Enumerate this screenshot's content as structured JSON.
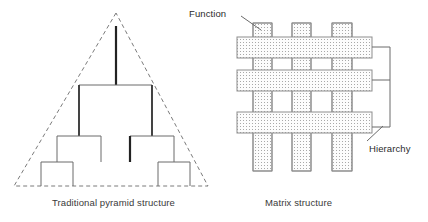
{
  "figure": {
    "background": "#ffffff",
    "stroke_color": "#555555",
    "bold_stroke_color": "#222222",
    "fill_color": "#fbfbfb",
    "pattern_color": "#9a9a9a"
  },
  "captions": {
    "pyramid": "Traditional pyramid structure",
    "matrix": "Matrix structure"
  },
  "annotations": {
    "function": {
      "label": "Function",
      "leader_from": [
        241,
        16
      ],
      "leader_to": [
        259,
        29
      ]
    },
    "hierarchy": {
      "label": "Hierarchy",
      "leader_from": [
        367,
        141
      ],
      "leader_to": [
        382,
        127
      ]
    }
  },
  "pyramid": {
    "triangle": {
      "apex": [
        116,
        13
      ],
      "left": [
        14,
        186
      ],
      "right": [
        208,
        186
      ],
      "dashed": true
    },
    "nodes": {
      "root_stem": {
        "x": 116,
        "y1": 26,
        "y2": 85,
        "bold": true
      },
      "level2_bar": {
        "y": 85,
        "x1": 79,
        "x2": 152
      },
      "level2_stems": [
        {
          "x": 79,
          "y1": 85,
          "y2": 136,
          "bold": true
        },
        {
          "x": 152,
          "y1": 85,
          "y2": 136,
          "bold": true
        }
      ],
      "level3_bars": [
        {
          "y": 136,
          "x1": 57,
          "x2": 101
        },
        {
          "y": 136,
          "x1": 130,
          "x2": 174
        }
      ],
      "level3_stems": [
        {
          "x": 57,
          "y1": 136,
          "y2": 162,
          "bold": false
        },
        {
          "x": 101,
          "y1": 136,
          "y2": 162,
          "bold": false
        },
        {
          "x": 130,
          "y1": 136,
          "y2": 162,
          "bold": true
        },
        {
          "x": 174,
          "y1": 136,
          "y2": 162,
          "bold": false
        }
      ],
      "level4_bars": [
        {
          "y": 162,
          "x1": 41,
          "x2": 73
        },
        {
          "y": 162,
          "x1": 158,
          "x2": 190
        }
      ],
      "level4_stems": [
        {
          "x": 41,
          "y1": 162,
          "y2": 186
        },
        {
          "x": 73,
          "y1": 162,
          "y2": 186
        },
        {
          "x": 158,
          "y1": 162,
          "y2": 186
        },
        {
          "x": 190,
          "y1": 162,
          "y2": 186
        }
      ]
    }
  },
  "matrix": {
    "vertical_bars": [
      {
        "name": "function-bar-1",
        "x": 253,
        "y": 23,
        "w": 19,
        "h": 148
      },
      {
        "name": "function-bar-2",
        "x": 292,
        "y": 23,
        "w": 19,
        "h": 148
      },
      {
        "name": "function-bar-3",
        "x": 332,
        "y": 23,
        "w": 20,
        "h": 148
      }
    ],
    "horizontal_bars": [
      {
        "name": "hierarchy-bar-1",
        "x": 237,
        "y": 37,
        "w": 135,
        "h": 21
      },
      {
        "name": "hierarchy-bar-2",
        "x": 237,
        "y": 70,
        "w": 135,
        "h": 21
      },
      {
        "name": "hierarchy-bar-3",
        "x": 237,
        "y": 112,
        "w": 135,
        "h": 21
      }
    ],
    "bracket": {
      "spine_x": 390,
      "spine_y1": 47,
      "spine_y2": 127,
      "stubs_y": [
        47,
        80,
        127
      ],
      "stub_x1": 372,
      "stub_x2": 390
    },
    "counts": {
      "functions": 3,
      "hierarchies": 3
    }
  }
}
